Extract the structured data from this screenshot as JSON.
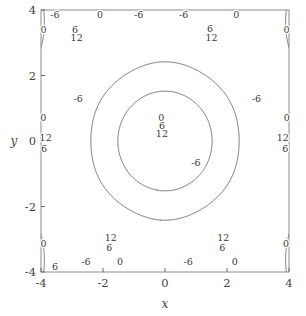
{
  "chart_data": {
    "type": "contour",
    "title": "",
    "xlabel": "x",
    "ylabel": "y",
    "xlim": [
      -4,
      4
    ],
    "ylim": [
      -4,
      4
    ],
    "xticks": [
      -4,
      -2,
      0,
      2,
      4
    ],
    "yticks": [
      -4,
      -2,
      0,
      2,
      4
    ],
    "xticklabels": [
      "-4",
      "-2",
      "0",
      "2",
      "4"
    ],
    "yticklabels": [
      "-4",
      "-2",
      "0",
      "2",
      "4"
    ],
    "levels": [
      -6,
      0,
      6,
      12
    ],
    "level_labels": [
      "-6",
      "0",
      "6",
      "12"
    ],
    "inline_labels": true,
    "grid": false,
    "legend": false,
    "colormap": "none-monochrome",
    "line_color": "#4a4a4a",
    "frame_color": "#8a8a8a",
    "background": "#ffffff",
    "function": "4*(cos(x)+cos(0.5*x+0.8660254*y)+cos(0.5*x-0.8660254*y))",
    "maxima_value": 12,
    "minima_value": -6,
    "peak_centers": [
      [
        0,
        0
      ],
      [
        3.6275,
        0
      ],
      [
        -3.6275,
        0
      ],
      [
        1.8138,
        3.1416
      ],
      [
        -1.8138,
        3.1416
      ],
      [
        1.8138,
        -3.1416
      ],
      [
        -1.8138,
        -3.1416
      ],
      [
        3.6275,
        6.2832
      ],
      [
        -3.6275,
        6.2832
      ]
    ],
    "contour_label_positions": [
      {
        "level": "6",
        "x": -2.9,
        "y": 3.3
      },
      {
        "level": "12",
        "x": -2.85,
        "y": 3.05
      },
      {
        "level": "0",
        "x": -2.1,
        "y": 3.95
      },
      {
        "level": "-6",
        "x": -0.85,
        "y": 3.92
      },
      {
        "level": "-6",
        "x": 0.6,
        "y": 3.92
      },
      {
        "level": "6",
        "x": 1.45,
        "y": 3.32
      },
      {
        "level": "12",
        "x": 1.5,
        "y": 3.05
      },
      {
        "level": "0",
        "x": 2.3,
        "y": 3.95
      },
      {
        "level": "-6",
        "x": -3.55,
        "y": 4.0
      },
      {
        "level": "0",
        "x": -3.92,
        "y": 3.3
      },
      {
        "level": "0",
        "x": 3.92,
        "y": 3.3
      },
      {
        "level": "-6",
        "x": -2.8,
        "y": 1.2
      },
      {
        "level": "0",
        "x": -3.93,
        "y": 0.62
      },
      {
        "level": "12",
        "x": -3.85,
        "y": 0.0
      },
      {
        "level": "6",
        "x": -3.9,
        "y": -0.35
      },
      {
        "level": "0",
        "x": -0.12,
        "y": 0.62
      },
      {
        "level": "6",
        "x": -0.1,
        "y": 0.38
      },
      {
        "level": "12",
        "x": -0.1,
        "y": 0.12
      },
      {
        "level": "-6",
        "x": 1.0,
        "y": -0.75
      },
      {
        "level": "-6",
        "x": 2.95,
        "y": 1.2
      },
      {
        "level": "0",
        "x": 3.93,
        "y": 0.62
      },
      {
        "level": "12",
        "x": 3.8,
        "y": 0.0
      },
      {
        "level": "6",
        "x": 3.88,
        "y": -0.35
      },
      {
        "level": "12",
        "x": -1.75,
        "y": -3.05
      },
      {
        "level": "6",
        "x": -1.8,
        "y": -3.35
      },
      {
        "level": "0",
        "x": -1.45,
        "y": -3.78
      },
      {
        "level": "-6",
        "x": -2.55,
        "y": -3.8
      },
      {
        "level": "12",
        "x": 1.88,
        "y": -3.05
      },
      {
        "level": "6",
        "x": 1.85,
        "y": -3.35
      },
      {
        "level": "0",
        "x": 2.25,
        "y": -3.78
      },
      {
        "level": "-6",
        "x": 0.75,
        "y": -3.8
      },
      {
        "level": "0",
        "x": -3.92,
        "y": -3.25
      },
      {
        "level": "6",
        "x": -3.55,
        "y": -3.95
      },
      {
        "level": "0",
        "x": 3.9,
        "y": -3.25
      }
    ]
  },
  "figure": {
    "axis_x_label": "x",
    "axis_y_label": "y"
  }
}
